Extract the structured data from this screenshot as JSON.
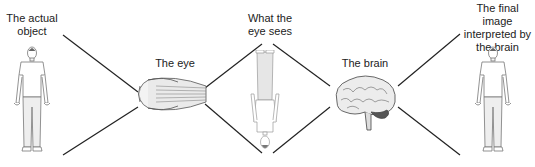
{
  "labels": {
    "actual_object": [
      "The actual",
      "object"
    ],
    "eye": "The eye",
    "eye_sees": [
      "What the",
      "eye sees"
    ],
    "brain": "The brain",
    "final_image": [
      "The final image",
      "interpreted by",
      "the brain"
    ]
  },
  "figures": {
    "actual_object": "standing-man-icon",
    "eye": "eyeball-icon",
    "eye_sees": "inverted-man-icon",
    "brain": "brain-icon",
    "final_image": "standing-man-icon"
  },
  "colors": {
    "line": "#222222",
    "figure_stroke": "#777777",
    "figure_fill": "#f2f2f2",
    "brain_fill": "#e8e8e8",
    "cerebellum": "#555555"
  }
}
